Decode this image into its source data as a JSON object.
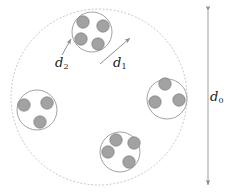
{
  "figure": {
    "title": "",
    "type": "schematic-diagram",
    "background": "#ffffff",
    "width": 240,
    "height": 195,
    "colors": {
      "outer_circle_stroke": "#b9b9b9",
      "cluster_stroke": "#8f8f8f",
      "particle_fill": "#a0a0a0",
      "particle_stroke": "#7c7c7c",
      "arrow_stroke": "#8a8a8a",
      "label_color": "#1a1a1a"
    },
    "outer_boundary": {
      "name": "outer-dashed-circle",
      "shape": "circle",
      "cx": 99,
      "cy": 97,
      "r": 88,
      "style": "dotted",
      "fill": "none"
    },
    "clusters": [
      {
        "name": "cluster-top",
        "cx": 92,
        "cy": 32,
        "r": 20,
        "particle_count": 4,
        "particles": [
          {
            "cx": 83,
            "cy": 22,
            "r": 6.2
          },
          {
            "cx": 103,
            "cy": 26,
            "r": 6.2
          },
          {
            "cx": 81,
            "cy": 39,
            "r": 6.2
          },
          {
            "cx": 98,
            "cy": 44,
            "r": 6.2
          }
        ]
      },
      {
        "name": "cluster-left",
        "cx": 37,
        "cy": 110,
        "r": 20,
        "particle_count": 3,
        "particles": [
          {
            "cx": 24,
            "cy": 105,
            "r": 6.2
          },
          {
            "cx": 47,
            "cy": 103,
            "r": 6.2
          },
          {
            "cx": 40,
            "cy": 122,
            "r": 6.2
          }
        ]
      },
      {
        "name": "cluster-right",
        "cx": 167,
        "cy": 99,
        "r": 20,
        "particle_count": 3,
        "particles": [
          {
            "cx": 165,
            "cy": 84,
            "r": 6.2
          },
          {
            "cx": 155,
            "cy": 102,
            "r": 6.2
          },
          {
            "cx": 179,
            "cy": 100,
            "r": 6.2
          }
        ]
      },
      {
        "name": "cluster-bottom",
        "cx": 120,
        "cy": 152,
        "r": 20,
        "particle_count": 4,
        "particles": [
          {
            "cx": 116,
            "cy": 140,
            "r": 6.2
          },
          {
            "cx": 134,
            "cy": 143,
            "r": 6.2
          },
          {
            "cx": 108,
            "cy": 152,
            "r": 6.2
          },
          {
            "cx": 129,
            "cy": 162,
            "r": 6.2
          }
        ]
      }
    ],
    "annotations": [
      {
        "name": "d2",
        "label": "d",
        "subscript": "2",
        "meaning": "particle diameter",
        "leader": {
          "x1": 62,
          "y1": 56,
          "x2": 71,
          "y2": 39,
          "arrowhead": "end"
        }
      },
      {
        "name": "d1",
        "label": "d",
        "subscript": "1",
        "meaning": "cluster diameter",
        "leader": {
          "x1": 100,
          "y1": 64,
          "x2": 130,
          "y2": 38,
          "arrowhead": "end"
        }
      },
      {
        "name": "d0",
        "label": "d",
        "subscript": "0",
        "meaning": "overall assembly diameter",
        "leader": {
          "x1": 208,
          "y1": 10,
          "x2": 208,
          "y2": 186,
          "arrowhead": "both"
        }
      }
    ]
  }
}
